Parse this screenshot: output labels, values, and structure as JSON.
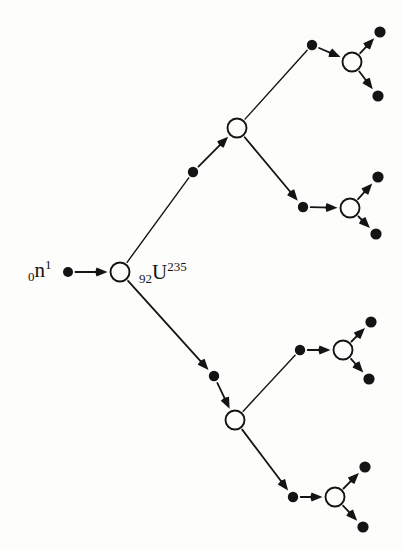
{
  "figure": {
    "background_color": "#fdfdfb",
    "ink_color": "#141414",
    "width": 402,
    "height": 550
  },
  "labels": {
    "neutron": {
      "name": "neutron-label",
      "sub": "0",
      "base": "n",
      "sup": "1",
      "plain": "0n1"
    },
    "uranium": {
      "name": "uranium-label",
      "sub": "92",
      "base": "U",
      "sup": "235",
      "plain": "92U235"
    }
  },
  "chart_data": {
    "type": "diagram",
    "subtype": "binary-branching-tree",
    "node_styles": {
      "nucleus": "open-circle",
      "neutron": "filled-dot"
    },
    "generations": 4,
    "counts": {
      "nuclei_circles": 7,
      "neutron_dots": 16,
      "arrows": 22
    },
    "nodes": [
      {
        "id": "n0",
        "type": "neutron",
        "x": 68,
        "y": 272,
        "r": 5.0,
        "generation": 0,
        "label": "0n1"
      },
      {
        "id": "u1",
        "type": "nucleus",
        "x": 120,
        "y": 272,
        "r": 9.5,
        "generation": 0,
        "label": "92U235"
      },
      {
        "id": "nA",
        "type": "neutron",
        "x": 193,
        "y": 172,
        "r": 5.2,
        "generation": 1
      },
      {
        "id": "uA",
        "type": "nucleus",
        "x": 237,
        "y": 128,
        "r": 9.5,
        "generation": 1
      },
      {
        "id": "nB",
        "type": "neutron",
        "x": 214,
        "y": 376,
        "r": 5.2,
        "generation": 1
      },
      {
        "id": "uB",
        "type": "nucleus",
        "x": 235,
        "y": 420,
        "r": 9.5,
        "generation": 1
      },
      {
        "id": "nA1",
        "type": "neutron",
        "x": 312,
        "y": 45,
        "r": 5.2,
        "generation": 2
      },
      {
        "id": "uA1",
        "type": "nucleus",
        "x": 352,
        "y": 62,
        "r": 9.5,
        "generation": 2
      },
      {
        "id": "nA2",
        "type": "neutron",
        "x": 303,
        "y": 207,
        "r": 5.2,
        "generation": 2
      },
      {
        "id": "uA2",
        "type": "nucleus",
        "x": 350,
        "y": 208,
        "r": 9.5,
        "generation": 2
      },
      {
        "id": "nB1",
        "type": "neutron",
        "x": 300,
        "y": 350,
        "r": 5.2,
        "generation": 2
      },
      {
        "id": "uB1",
        "type": "nucleus",
        "x": 343,
        "y": 350,
        "r": 9.5,
        "generation": 2
      },
      {
        "id": "nB2",
        "type": "neutron",
        "x": 293,
        "y": 497,
        "r": 5.2,
        "generation": 2
      },
      {
        "id": "uB2",
        "type": "nucleus",
        "x": 335,
        "y": 497,
        "r": 9.5,
        "generation": 2
      },
      {
        "id": "tA1a",
        "type": "neutron",
        "x": 380,
        "y": 32,
        "r": 5.6,
        "generation": 3
      },
      {
        "id": "tA1b",
        "type": "neutron",
        "x": 378,
        "y": 96,
        "r": 5.6,
        "generation": 3
      },
      {
        "id": "tA2a",
        "type": "neutron",
        "x": 378,
        "y": 177,
        "r": 5.6,
        "generation": 3
      },
      {
        "id": "tA2b",
        "type": "neutron",
        "x": 376,
        "y": 234,
        "r": 5.6,
        "generation": 3
      },
      {
        "id": "tB1a",
        "type": "neutron",
        "x": 371,
        "y": 322,
        "r": 5.6,
        "generation": 3
      },
      {
        "id": "tB1b",
        "type": "neutron",
        "x": 369,
        "y": 379,
        "r": 5.6,
        "generation": 3
      },
      {
        "id": "tB2a",
        "type": "neutron",
        "x": 365,
        "y": 467,
        "r": 5.6,
        "generation": 3
      },
      {
        "id": "tB2b",
        "type": "neutron",
        "x": 363,
        "y": 527,
        "r": 5.6,
        "generation": 3
      }
    ],
    "edges": [
      {
        "from": "n0",
        "to": "u1",
        "arrow": true,
        "kind": "capture"
      },
      {
        "from": "u1",
        "to": "nA",
        "arrow": false,
        "kind": "emission"
      },
      {
        "from": "nA",
        "to": "uA",
        "arrow": true,
        "kind": "capture"
      },
      {
        "from": "u1",
        "to": "nB",
        "arrow": true,
        "kind": "emission"
      },
      {
        "from": "nB",
        "to": "uB",
        "arrow": true,
        "kind": "capture"
      },
      {
        "from": "uA",
        "to": "nA1",
        "arrow": false,
        "kind": "emission"
      },
      {
        "from": "nA1",
        "to": "uA1",
        "arrow": true,
        "kind": "capture"
      },
      {
        "from": "uA",
        "to": "nA2",
        "arrow": true,
        "kind": "emission"
      },
      {
        "from": "nA2",
        "to": "uA2",
        "arrow": true,
        "kind": "capture"
      },
      {
        "from": "uB",
        "to": "nB1",
        "arrow": false,
        "kind": "emission"
      },
      {
        "from": "nB1",
        "to": "uB1",
        "arrow": true,
        "kind": "capture"
      },
      {
        "from": "uB",
        "to": "nB2",
        "arrow": true,
        "kind": "emission"
      },
      {
        "from": "nB2",
        "to": "uB2",
        "arrow": true,
        "kind": "capture"
      },
      {
        "from": "uA1",
        "to": "tA1a",
        "arrow": true,
        "kind": "emission"
      },
      {
        "from": "uA1",
        "to": "tA1b",
        "arrow": true,
        "kind": "emission"
      },
      {
        "from": "uA2",
        "to": "tA2a",
        "arrow": true,
        "kind": "emission"
      },
      {
        "from": "uA2",
        "to": "tA2b",
        "arrow": true,
        "kind": "emission"
      },
      {
        "from": "uB1",
        "to": "tB1a",
        "arrow": true,
        "kind": "emission"
      },
      {
        "from": "uB1",
        "to": "tB1b",
        "arrow": true,
        "kind": "emission"
      },
      {
        "from": "uB2",
        "to": "tB2a",
        "arrow": true,
        "kind": "emission"
      },
      {
        "from": "uB2",
        "to": "tB2b",
        "arrow": true,
        "kind": "emission"
      }
    ]
  }
}
